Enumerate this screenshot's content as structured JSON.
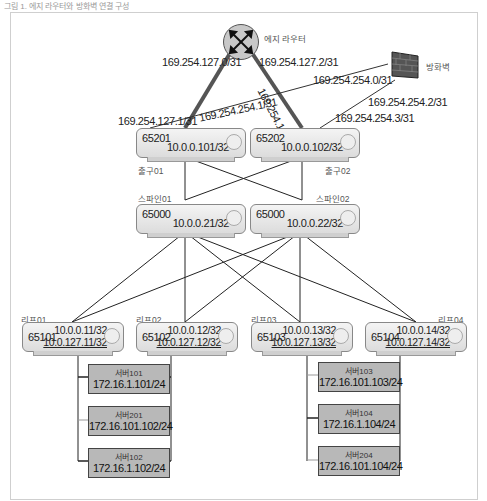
{
  "caption": "그림 1. 에지 라우터와 방화벽 연결 구성",
  "edge_router": {
    "name": "에지 라우터"
  },
  "firewall": {
    "name": "방화벽"
  },
  "links": {
    "edge_left": "169.254.127.0/31",
    "edge_right": "169.254.127.2/31",
    "exit1_edge": "169.254.127.1/31",
    "exit2_edge": "169.254.127.3/31",
    "fw_left": "169.254.254.0/31",
    "fw_right": "169.254.254.2/31",
    "exit1_fw": "169.254.254.1/31",
    "exit2_fw": "169.254.254.3/31"
  },
  "exits": [
    {
      "name": "출구01",
      "asn": "65201",
      "ip": "10.0.0.101/32"
    },
    {
      "name": "출구02",
      "asn": "65202",
      "ip": "10.0.0.102/32"
    }
  ],
  "spines": [
    {
      "name": "스파인01",
      "asn": "65000",
      "ip": "10.0.0.21/32"
    },
    {
      "name": "스파인02",
      "asn": "65000",
      "ip": "10.0.0.22/32"
    }
  ],
  "leaves": [
    {
      "name": "리프01",
      "asn": "65101",
      "ip": "10.0.0.11/32",
      "ip2": "10.0.127.11/32"
    },
    {
      "name": "리프02",
      "asn": "65102",
      "ip": "10.0.0.12/32",
      "ip2": "10.0.127.12/32"
    },
    {
      "name": "리프03",
      "asn": "65103",
      "ip": "10.0.0.13/32",
      "ip2": "10.0.127.13/32"
    },
    {
      "name": "리프04",
      "asn": "65104",
      "ip": "10.0.0.14/32",
      "ip2": "10.0.127.14/32"
    }
  ],
  "servers_left": [
    {
      "name": "서버101",
      "ip": "172.16.1.101/24"
    },
    {
      "name": "서버201",
      "ip": "172.16.101.102/24"
    },
    {
      "name": "서버102",
      "ip": "172.16.1.102/24"
    }
  ],
  "servers_right": [
    {
      "name": "서버103",
      "ip": "172.16.101.103/24"
    },
    {
      "name": "서버104",
      "ip": "172.16.1.104/24"
    },
    {
      "name": "서버204",
      "ip": "172.16.101.104/24"
    }
  ]
}
